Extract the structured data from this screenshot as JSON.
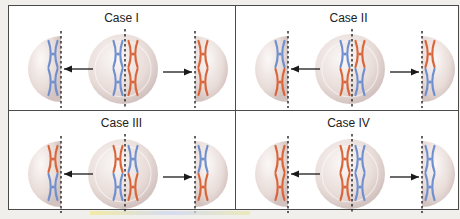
{
  "figure": {
    "colors": {
      "maternal": "#d9663a",
      "paternal": "#6f8fcf",
      "cell_fill": "#e8dcd8",
      "cell_rim": "#d3c3c0",
      "border": "#4a4a4a",
      "arrow": "#1a1a1a"
    },
    "panels": [
      {
        "id": "case-1",
        "title": "Case I",
        "center_left_column": [
          "paternal",
          "paternal"
        ],
        "center_right_column": [
          "maternal",
          "maternal"
        ],
        "left_daughter": [
          "paternal",
          "paternal"
        ],
        "right_daughter": [
          "maternal",
          "maternal"
        ]
      },
      {
        "id": "case-2",
        "title": "Case II",
        "center_left_column": [
          "paternal",
          "maternal"
        ],
        "center_right_column": [
          "maternal",
          "paternal"
        ],
        "left_daughter": [
          "paternal",
          "maternal"
        ],
        "right_daughter": [
          "maternal",
          "paternal"
        ]
      },
      {
        "id": "case-3",
        "title": "Case III",
        "center_left_column": [
          "maternal",
          "paternal"
        ],
        "center_right_column": [
          "paternal",
          "maternal"
        ],
        "left_daughter": [
          "maternal",
          "paternal"
        ],
        "right_daughter": [
          "paternal",
          "maternal"
        ]
      },
      {
        "id": "case-4",
        "title": "Case IV",
        "center_left_column": [
          "maternal",
          "maternal"
        ],
        "center_right_column": [
          "paternal",
          "paternal"
        ],
        "left_daughter": [
          "maternal",
          "maternal"
        ],
        "right_daughter": [
          "paternal",
          "paternal"
        ]
      }
    ]
  }
}
